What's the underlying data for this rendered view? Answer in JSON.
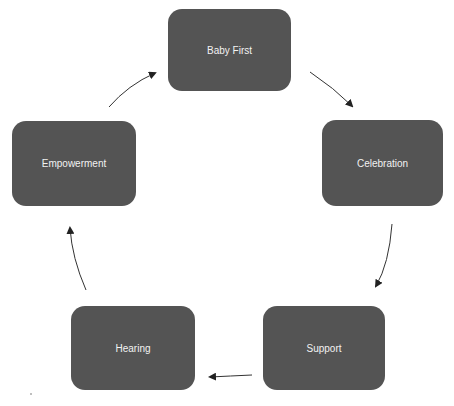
{
  "diagram": {
    "type": "cycle",
    "nodes": [
      {
        "id": "baby-first",
        "label": "Baby First"
      },
      {
        "id": "celebration",
        "label": "Celebration"
      },
      {
        "id": "support",
        "label": "Support"
      },
      {
        "id": "hearing",
        "label": "Hearing"
      },
      {
        "id": "empowerment",
        "label": "Empowerment"
      }
    ],
    "edges": [
      {
        "from": "baby-first",
        "to": "celebration"
      },
      {
        "from": "celebration",
        "to": "support"
      },
      {
        "from": "support",
        "to": "hearing"
      },
      {
        "from": "hearing",
        "to": "empowerment"
      },
      {
        "from": "empowerment",
        "to": "baby-first"
      }
    ],
    "colors": {
      "node_fill": "#545454",
      "node_text": "#f2f2f2",
      "arrow": "#222222",
      "background": "#ffffff"
    }
  }
}
